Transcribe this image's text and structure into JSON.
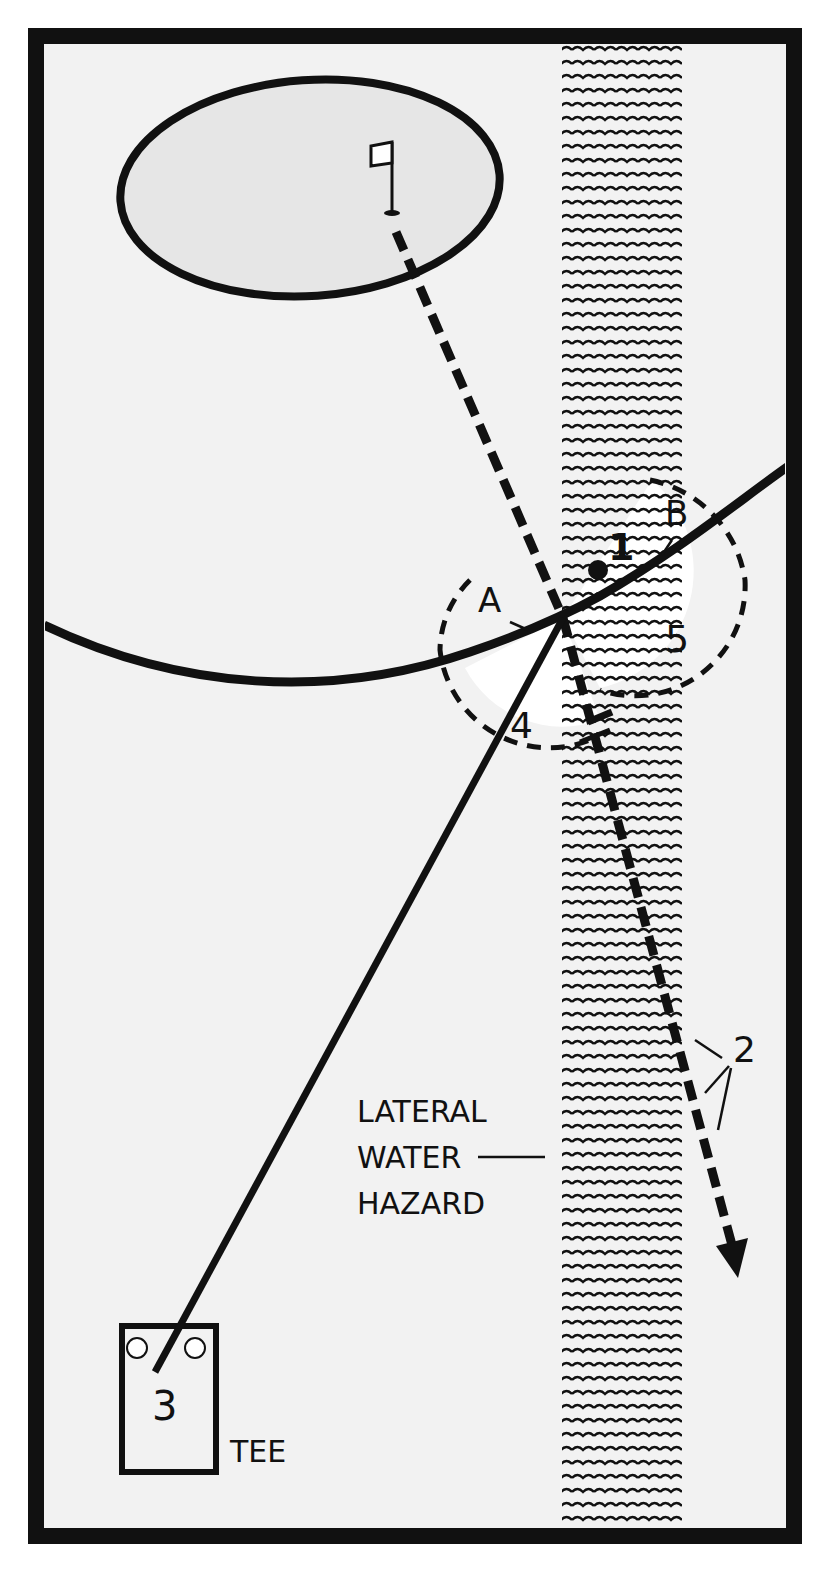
{
  "diagram": {
    "type": "golf-rule-illustration",
    "labels": {
      "point_a": "A",
      "point_b": "B",
      "ball_position": "1",
      "drop_option_2": "2",
      "tee_option_3": "3",
      "drop_zone_4": "4",
      "drop_zone_5": "5",
      "hazard_line1": "LATERAL",
      "hazard_line2": "WATER",
      "hazard_line3": "HAZARD",
      "tee": "TEE"
    },
    "colors": {
      "ink": "#111111",
      "background": "#f2f2f2",
      "frame": "#111111",
      "drop_zone": "#ffffff"
    },
    "elements": [
      {
        "name": "green",
        "shape": "ellipse"
      },
      {
        "name": "flag",
        "shape": "flagstick"
      },
      {
        "name": "hazard-strip",
        "shape": "wavy-water-band"
      },
      {
        "name": "hazard-margin-line",
        "shape": "curve"
      },
      {
        "name": "ball-flight-path",
        "shape": "solid-line",
        "from": "tee",
        "to": "entry-point"
      },
      {
        "name": "flag-line",
        "shape": "dashed-line",
        "from": "flag",
        "through": "entry-point",
        "ending": "arrow"
      },
      {
        "name": "drop-zone-a",
        "shape": "dashed-semicircle"
      },
      {
        "name": "drop-zone-b",
        "shape": "dashed-semicircle"
      },
      {
        "name": "tee-box",
        "shape": "rectangle-with-markers"
      }
    ]
  }
}
